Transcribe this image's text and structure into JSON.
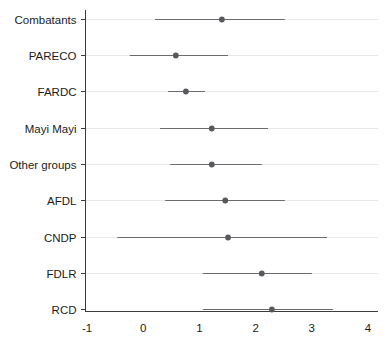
{
  "chart_data": {
    "type": "scatter",
    "subtype": "forest-plot",
    "title": "",
    "subtitle": "",
    "xlabel": "",
    "ylabel": "",
    "xlim": [
      -1,
      4
    ],
    "ylim": [
      0,
      9
    ],
    "grid": true,
    "grid_axis": "y",
    "legend": "none",
    "xticks": [
      -1,
      0,
      1,
      2,
      3,
      4
    ],
    "xticklabels": [
      "-1",
      "0",
      "1",
      "2",
      "3",
      "4"
    ],
    "categories": [
      "Combatants",
      "PARECO",
      "FARDC",
      "Mayi Mayi",
      "Other groups",
      "AFDL",
      "CNDP",
      "FDLR",
      "RCD"
    ],
    "values": [
      1.4,
      0.58,
      0.76,
      1.22,
      1.22,
      1.46,
      1.51,
      2.11,
      2.29
    ],
    "ci_low": [
      0.21,
      -0.24,
      0.44,
      0.3,
      0.48,
      0.39,
      -0.46,
      1.06,
      1.06
    ],
    "ci_high": [
      2.52,
      1.51,
      1.1,
      2.22,
      2.11,
      2.52,
      3.27,
      3.0,
      3.38
    ],
    "points": [
      {
        "label": "Combatants",
        "estimate": 1.4,
        "ci_low": 0.21,
        "ci_high": 2.52
      },
      {
        "label": "PARECO",
        "estimate": 0.58,
        "ci_low": -0.24,
        "ci_high": 1.51
      },
      {
        "label": "FARDC",
        "estimate": 0.76,
        "ci_low": 0.44,
        "ci_high": 1.1
      },
      {
        "label": "Mayi Mayi",
        "estimate": 1.22,
        "ci_low": 0.3,
        "ci_high": 2.22
      },
      {
        "label": "Other groups",
        "estimate": 1.22,
        "ci_low": 0.48,
        "ci_high": 2.11
      },
      {
        "label": "AFDL",
        "estimate": 1.46,
        "ci_low": 0.39,
        "ci_high": 2.52
      },
      {
        "label": "CNDP",
        "estimate": 1.51,
        "ci_low": -0.46,
        "ci_high": 3.27
      },
      {
        "label": "FDLR",
        "estimate": 2.11,
        "ci_low": 1.06,
        "ci_high": 3.0
      },
      {
        "label": "RCD",
        "estimate": 2.29,
        "ci_low": 1.06,
        "ci_high": 3.38
      }
    ],
    "colors": {
      "point": "#59595d",
      "ci": "#6b6b6f",
      "axis": "#3c3c3c",
      "grid": "#e9e9ea",
      "background": "#ffffff",
      "text": "#1b1b1b"
    }
  }
}
